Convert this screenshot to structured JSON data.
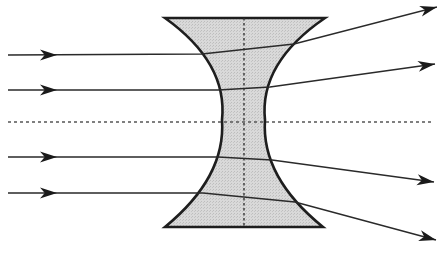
{
  "diagram": {
    "type": "concave-lens-ray-diagram",
    "colors": {
      "background": "#ffffff",
      "lens_fill": "#d6d6d6",
      "lens_stroke": "#1e1e1e",
      "ray": "#2a2a2a",
      "axis": "#555555"
    },
    "lens": {
      "top_y": 18,
      "bottom_y": 227,
      "top_left_x": 165,
      "top_right_x": 325,
      "bottom_left_x": 165,
      "bottom_right_x": 323,
      "waist_y": 120,
      "waist_left_x": 222,
      "waist_right_x": 265
    },
    "principal_axis": {
      "y": 122,
      "x_start": 8,
      "x_end": 433,
      "style": "dotted"
    },
    "lens_axis": {
      "x": 244,
      "y_start": 18,
      "y_end": 227,
      "style": "dotted"
    },
    "rays": [
      {
        "id": 1,
        "incident_y": 55,
        "enter": [
          202,
          54
        ],
        "exit": [
          294,
          44
        ],
        "end": [
          437,
          7
        ]
      },
      {
        "id": 2,
        "incident_y": 90,
        "enter": [
          218,
          90
        ],
        "exit": [
          270,
          87
        ],
        "end": [
          435,
          64
        ]
      },
      {
        "id": 3,
        "incident_y": 157,
        "enter": [
          218,
          157
        ],
        "exit": [
          272,
          160
        ],
        "end": [
          434,
          182
        ]
      },
      {
        "id": 4,
        "incident_y": 193,
        "enter": [
          203,
          193
        ],
        "exit": [
          295,
          202
        ],
        "end": [
          436,
          240
        ]
      }
    ],
    "incident_arrow_x": 57,
    "ray_start_x": 8
  }
}
